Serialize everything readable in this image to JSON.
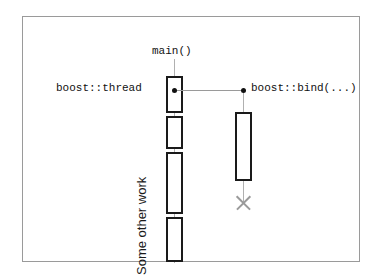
{
  "diagram": {
    "title_text": "",
    "background_color": "#ffffff",
    "frame_color": "#9a9a9a",
    "line_color": "#b0b0b0",
    "box_border_color": "#1a1a1a",
    "dot_color": "#111111",
    "termination_color": "#9a9a9a"
  },
  "labels": {
    "main": "main()",
    "thread": "boost::thread",
    "bind": "boost::bind(...)",
    "other_work": "Some other work"
  },
  "lifelines": [
    {
      "name": "main",
      "label": "main()",
      "x": 151,
      "activations": [
        {
          "top": 59,
          "height": 37
        },
        {
          "top": 99,
          "height": 33
        },
        {
          "top": 135,
          "height": 62
        },
        {
          "top": 200,
          "height": 45
        }
      ]
    },
    {
      "name": "worker",
      "label": "boost::bind(...)",
      "x": 220,
      "terminated": true,
      "activations": [
        {
          "top": 95,
          "height": 69
        }
      ]
    }
  ],
  "messages": [
    {
      "from": "main",
      "to": "worker",
      "y": 73,
      "from_label": "boost::thread",
      "to_label": "boost::bind(...)"
    }
  ]
}
